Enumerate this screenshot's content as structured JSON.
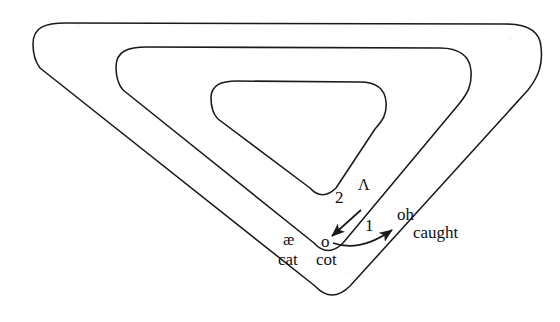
{
  "figure": {
    "type": "vowel-space-diagram",
    "title": "",
    "stroke_color": "#1a1a1a",
    "text_color": "#111111",
    "background_color": "#ffffff"
  },
  "contours": [
    {
      "name": "outer-triangle",
      "label": "outer vowel space boundary",
      "path": "M 33 44 C 33 27 45 23 66 23 L 505 24 C 527 24 540 31 541 47 C 543 64 539 76 528 90 L 350 286 C 338 298 326 298 315 286 L 40 68 C 34 60 33 53 33 44 Z"
    },
    {
      "name": "middle-triangle",
      "label": "middle vowel space boundary",
      "path": "M 116 67 C 116 51 128 47 147 47 L 440 48 C 459 48 470 56 471 71 C 472 85 468 93 459 104 L 343 243 C 333 253 323 253 314 243 L 123 90 C 117 83 116 75 116 67 Z"
    },
    {
      "name": "inner-triangle",
      "label": "inner vowel space boundary",
      "path": "M 211 98 C 211 85 221 81 237 81 L 360 82 C 376 82 385 89 386 102 C 387 114 383 120 375 129 L 336 188 C 327 197 318 197 310 188 L 218 119 C 212 113 211 105 211 98 Z"
    }
  ],
  "arrows": [
    {
      "name": "arrow-2",
      "number_label": "2",
      "description": "straight arrow pointing down-left from the wedge vowel toward the low back vowel",
      "from": [
        361,
        210
      ],
      "to": [
        332,
        236
      ],
      "number_pos": [
        338,
        198
      ],
      "style": "straight"
    },
    {
      "name": "arrow-1",
      "number_label": "1",
      "description": "curved arrow from the low back vowel rightward and upward toward the mid back rounded vowel",
      "from": [
        334,
        242
      ],
      "to": [
        398,
        226
      ],
      "number_pos": [
        368,
        228
      ],
      "style": "curved"
    }
  ],
  "labels": [
    {
      "name": "vowel-ash",
      "kind": "vowel",
      "text": "æ",
      "x": 285,
      "y": 232
    },
    {
      "name": "vowel-open-o",
      "kind": "vowel",
      "text": "o",
      "x": 322,
      "y": 234
    },
    {
      "name": "vowel-wedge",
      "kind": "wedge",
      "text": "Λ",
      "x": 360,
      "y": 178
    },
    {
      "name": "vowel-oh",
      "kind": "vowel",
      "text": "oh",
      "x": 399,
      "y": 208
    },
    {
      "name": "word-cat",
      "kind": "word",
      "text": "cat",
      "x": 280,
      "y": 252
    },
    {
      "name": "word-cot",
      "kind": "word",
      "text": "cot",
      "x": 318,
      "y": 252
    },
    {
      "name": "word-caught",
      "kind": "word",
      "text": "caught",
      "x": 415,
      "y": 225
    }
  ],
  "numbers": [
    {
      "name": "arrow-number-2",
      "text": "2",
      "x": 336,
      "y": 190
    },
    {
      "name": "arrow-number-1",
      "text": "1",
      "x": 366,
      "y": 218
    }
  ]
}
